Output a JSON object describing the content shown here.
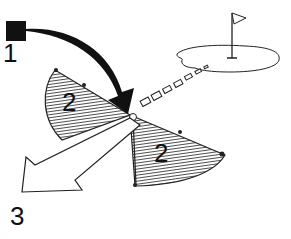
{
  "diagram": {
    "labels": {
      "start": "1",
      "zone_left": "2",
      "zone_right": "2",
      "exit": "3"
    },
    "colors": {
      "ink": "#111111",
      "background": "#ffffff"
    }
  }
}
